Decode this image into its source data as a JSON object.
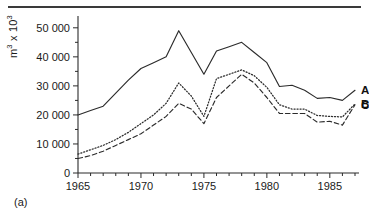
{
  "figure": {
    "caption": "(a)",
    "ylabel_prefix": "m",
    "ylabel_exp1": "3",
    "ylabel_mid": " x 10",
    "ylabel_exp2": "3"
  },
  "chart_data": {
    "type": "line",
    "title": "",
    "xlabel": "",
    "ylabel": "m3 x 103",
    "xlim": [
      1965,
      1987
    ],
    "ylim": [
      0,
      52000
    ],
    "grid": false,
    "legend_position": "right-inline",
    "x_ticks_major": [
      1965,
      1970,
      1975,
      1980,
      1985
    ],
    "x_tick_labels": [
      "1965",
      "1970",
      "1975",
      "1980",
      "1985"
    ],
    "x_minor_step": 1,
    "y_ticks_major": [
      0,
      10000,
      20000,
      30000,
      40000,
      50000
    ],
    "y_tick_labels": [
      "0",
      "10 000",
      "20 000",
      "30 000",
      "40 000",
      "50 000"
    ],
    "y_minor_step": 5000,
    "x": [
      1965,
      1966,
      1967,
      1968,
      1969,
      1970,
      1971,
      1972,
      1973,
      1974,
      1975,
      1976,
      1977,
      1978,
      1979,
      1980,
      1981,
      1982,
      1983,
      1984,
      1985,
      1986,
      1987
    ],
    "series": [
      {
        "name": "A",
        "label": "A",
        "style": "solid",
        "values": [
          20000,
          21500,
          23000,
          27500,
          32000,
          36000,
          38000,
          40000,
          49000,
          41500,
          34000,
          42000,
          43500,
          45000,
          41500,
          38000,
          29800,
          30200,
          28500,
          25700,
          26000,
          25000,
          28500
        ]
      },
      {
        "name": "B",
        "label": "B",
        "style": "dotted",
        "values": [
          6500,
          8000,
          9500,
          11500,
          14000,
          17000,
          20000,
          24000,
          31000,
          26500,
          19500,
          32500,
          34000,
          35500,
          33500,
          29500,
          23500,
          22000,
          22000,
          19800,
          19500,
          19300,
          23800
        ]
      },
      {
        "name": "C",
        "label": "C",
        "style": "dashed",
        "values": [
          5000,
          6000,
          7500,
          9500,
          11500,
          13500,
          16500,
          19500,
          24000,
          22000,
          17000,
          26000,
          30000,
          34000,
          31000,
          26000,
          20500,
          20500,
          20500,
          17500,
          17800,
          16500,
          23500
        ]
      }
    ]
  }
}
